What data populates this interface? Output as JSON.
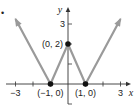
{
  "chart_data": {
    "type": "line",
    "title": "",
    "xlabel": "x",
    "ylabel": "y",
    "xlim": [
      -3.5,
      3.5
    ],
    "ylim": [
      -1,
      4
    ],
    "x_ticks": [
      -3,
      -2,
      -1,
      1,
      2,
      3
    ],
    "x_tick_labels": [
      {
        "x": -3,
        "label": "−3"
      },
      {
        "x": 3,
        "label": "3"
      }
    ],
    "y_ticks": [
      1,
      2,
      3,
      -1
    ],
    "y_tick_labels": [
      {
        "y": 3,
        "label": "3"
      }
    ],
    "series": [
      {
        "name": "f",
        "color": "#9a9a9a",
        "points": [
          [
            -3,
            3.25
          ],
          [
            -1,
            0
          ],
          [
            0,
            2
          ],
          [
            1,
            0
          ],
          [
            3,
            3.25
          ]
        ],
        "arrows_at_ends": true
      }
    ],
    "marked_points": [
      {
        "x": -1,
        "y": 0,
        "label": "(−1, 0)",
        "label_pos": "below"
      },
      {
        "x": 0,
        "y": 2,
        "label": "(0, 2)",
        "label_pos": "left"
      },
      {
        "x": 1,
        "y": 0,
        "label": "(1, 0)",
        "label_pos": "below"
      }
    ],
    "grid": false,
    "legend": "none"
  },
  "bullet": "•"
}
